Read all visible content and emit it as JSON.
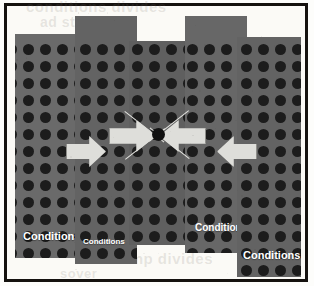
{
  "figure": {
    "background_color": "#fdfdfb",
    "frame_color": "#15120f",
    "panel_color": "#6b6b6b",
    "dot_color": "#1c1c1c",
    "arrow_color": "#dededa",
    "focus_dot_color": "#111111",
    "label_color": "#ffffff"
  },
  "panels": [
    {
      "id": "panel-1",
      "label": "Conditions",
      "x": 6,
      "y": 26,
      "w": 68,
      "h": 224,
      "label_x": 8,
      "label_y": 196,
      "label_size": 11,
      "dot_cols": 4,
      "dot_rows": 12,
      "dot_origin_x": 8,
      "dot_origin_y": 10,
      "dot_step_x": 17,
      "dot_step_y": 17,
      "dot_size": 11
    },
    {
      "id": "panel-2",
      "label": "Conditions",
      "x": 66,
      "y": 8,
      "w": 62,
      "h": 248,
      "label_x": 8,
      "label_y": 221,
      "label_size": 8,
      "dot_cols": 4,
      "dot_rows": 12,
      "dot_origin_x": 5,
      "dot_origin_y": 28,
      "dot_step_x": 17,
      "dot_step_y": 17,
      "dot_size": 11
    },
    {
      "id": "panel-3",
      "label": "",
      "x": 120,
      "y": 33,
      "w": 64,
      "h": 204,
      "label_x": 0,
      "label_y": 0,
      "label_size": 10,
      "dot_cols": 4,
      "dot_rows": 12,
      "dot_origin_x": 3,
      "dot_origin_y": 3,
      "dot_step_x": 17,
      "dot_step_y": 17,
      "dot_size": 11
    },
    {
      "id": "panel-4",
      "label": "Conditions",
      "x": 176,
      "y": 8,
      "w": 62,
      "h": 237,
      "label_x": 10,
      "label_y": 206,
      "label_size": 10,
      "dot_cols": 4,
      "dot_rows": 12,
      "dot_origin_x": 2,
      "dot_origin_y": 28,
      "dot_step_x": 17,
      "dot_step_y": 17,
      "dot_size": 11
    },
    {
      "id": "panel-5",
      "label": "Conditions",
      "x": 228,
      "y": 29,
      "w": 64,
      "h": 240,
      "label_x": 6,
      "label_y": 212,
      "label_size": 11,
      "dot_cols": 4,
      "dot_rows": 12,
      "dot_origin_x": 4,
      "dot_origin_y": 7,
      "dot_step_x": 17,
      "dot_step_y": 17,
      "dot_size": 11
    }
  ],
  "arrows": [
    {
      "id": "arrow-outer-left",
      "direction": "right",
      "x": 57,
      "y": 128,
      "w": 38,
      "h": 29
    },
    {
      "id": "arrow-inner-left",
      "direction": "right",
      "x": 100,
      "y": 112,
      "w": 45,
      "h": 30
    },
    {
      "id": "arrow-inner-right",
      "direction": "left",
      "x": 150,
      "y": 112,
      "w": 45,
      "h": 30
    },
    {
      "id": "arrow-outer-right",
      "direction": "left",
      "x": 208,
      "y": 128,
      "w": 38,
      "h": 29
    }
  ],
  "convergence_lines": [
    {
      "id": "line-nw-se",
      "x": 116,
      "y": 103,
      "length": 50,
      "angle": 38
    },
    {
      "id": "line-ne-sw",
      "x": 180,
      "y": 103,
      "length": 50,
      "angle": 142
    },
    {
      "id": "line-sw-ne",
      "x": 116,
      "y": 151,
      "length": 50,
      "angle": -38
    },
    {
      "id": "line-se-nw",
      "x": 180,
      "y": 151,
      "length": 50,
      "angle": -142
    }
  ],
  "focus_point": {
    "id": "focus-dot",
    "x": 143,
    "y": 120,
    "size": 13
  },
  "ghost_text": {
    "line1": "conditions  divides",
    "line2": "ad  structure",
    "line3": "ump divides",
    "line4": "sover"
  }
}
